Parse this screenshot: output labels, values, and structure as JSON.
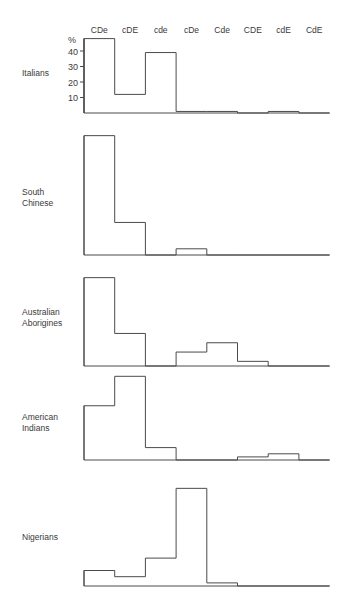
{
  "chart_data": {
    "type": "bar",
    "title": "",
    "xlabel": "",
    "ylabel": "%",
    "ylim": [
      0,
      50
    ],
    "yticks": [
      10,
      20,
      30,
      40
    ],
    "grid": false,
    "legend": null,
    "categories": [
      "CDe",
      "cDE",
      "cde",
      "cDe",
      "Cde",
      "CDE",
      "cdE",
      "CdE"
    ],
    "series": [
      {
        "name": "Italians",
        "label_lines": [
          "Italians"
        ],
        "values": [
          48,
          12,
          39,
          1,
          1,
          0,
          1,
          0
        ]
      },
      {
        "name": "South Chinese",
        "label_lines": [
          "South",
          "Chinese"
        ],
        "values": [
          77,
          21,
          0,
          4,
          0,
          0,
          0,
          0
        ]
      },
      {
        "name": "Australian Aborigines",
        "label_lines": [
          "Australian",
          "Aborigines"
        ],
        "values": [
          57,
          21,
          0,
          9,
          15,
          3,
          0,
          0
        ]
      },
      {
        "name": "American Indians",
        "label_lines": [
          "American",
          "Indians"
        ],
        "values": [
          35,
          54,
          8,
          0,
          0,
          2,
          4,
          0
        ]
      },
      {
        "name": "Nigerians",
        "label_lines": [
          "Nigerians"
        ],
        "values": [
          10,
          6,
          18,
          63,
          2,
          0,
          0,
          0
        ]
      }
    ]
  },
  "layout": {
    "axis_x": 84,
    "col_width": 30.7,
    "px_per_pct": 1.55,
    "baselines": [
      113,
      255,
      366,
      460,
      586
    ],
    "label_y": [
      76,
      195,
      315,
      420,
      540
    ],
    "category_label_y": 33,
    "percent_label": "%"
  }
}
